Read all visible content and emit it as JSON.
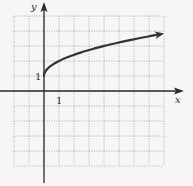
{
  "chart_data": {
    "type": "line",
    "title": "",
    "function": "y = 1 + sqrt(x)",
    "xlabel": "x",
    "ylabel": "y",
    "xlim": [
      -2,
      8
    ],
    "ylim": [
      -5,
      5
    ],
    "grid": true,
    "grid_style": "dotted",
    "tick_labels": {
      "x": [
        "1"
      ],
      "y": [
        "1"
      ]
    },
    "series": [
      {
        "name": "curve",
        "x": [
          0,
          0.25,
          0.5,
          1,
          2,
          3,
          4,
          5,
          6,
          7,
          8
        ],
        "y": [
          1,
          1.5,
          1.71,
          2,
          2.41,
          2.73,
          3,
          3.24,
          3.45,
          3.65,
          3.83
        ],
        "arrow_end": true
      }
    ],
    "legend": null
  },
  "axes": {
    "x_label": "x",
    "y_label": "y",
    "x_tick": "1",
    "y_tick": "1"
  },
  "colors": {
    "background": "#f7f6f4",
    "grid": "#8a8a8a",
    "axis": "#2a2a2a",
    "curve": "#333333"
  }
}
